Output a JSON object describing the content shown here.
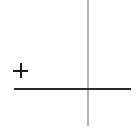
{
  "figure": {
    "title": "",
    "background_color": "#ffffff",
    "width": 137,
    "height": 129
  },
  "chart_data": {
    "type": "scatter",
    "title": "",
    "subtitle": "",
    "xlabel": "",
    "ylabel": "",
    "grid": false,
    "legend": null,
    "axes": {
      "vertical_axis": {
        "name": "y-axis",
        "orientation": "vertical",
        "color": "#b3b3b3",
        "x_pixel": 87,
        "y_start_pixel": 0,
        "y_end_pixel": 126,
        "thickness_px": 2,
        "tick_labels": []
      },
      "horizontal_axis": {
        "name": "x-axis",
        "orientation": "horizontal",
        "color": "#2b2b2b",
        "y_pixel": 88,
        "x_start_pixel": 14,
        "x_end_pixel": 131,
        "thickness_px": 2,
        "tick_labels": []
      }
    },
    "origin_pixel": {
      "x": 87,
      "y": 89
    },
    "markers": [
      {
        "symbol": "+",
        "label": "plus-marker",
        "color": "#1a1a1a",
        "center_pixel": {
          "x": 21,
          "y": 71
        },
        "size_px": 15,
        "quadrant": "upper-left",
        "x": -66,
        "y": 18
      }
    ],
    "series": [
      {
        "name": "plus points",
        "marker": "+",
        "x": [
          -66
        ],
        "y": [
          18
        ]
      }
    ],
    "annotations": [],
    "xlim": [
      -87,
      50
    ],
    "ylim": [
      -37,
      89
    ]
  }
}
